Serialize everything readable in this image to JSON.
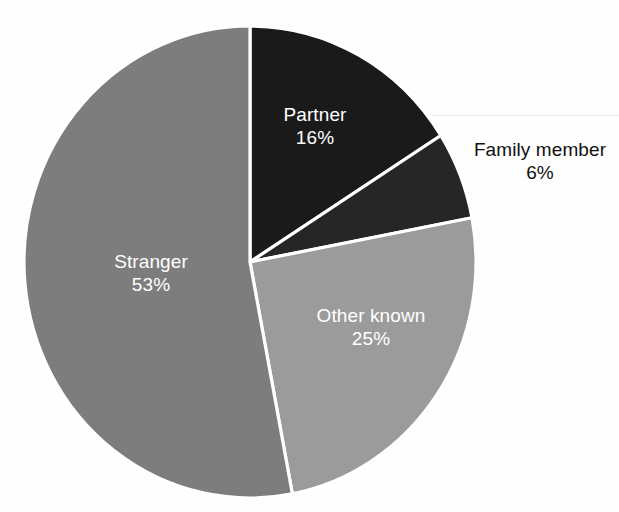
{
  "chart_data": {
    "type": "pie",
    "title": "",
    "subtitle": "",
    "xlabel": "",
    "ylabel": "",
    "legend_position": "none",
    "grid": false,
    "value_unit": "%",
    "start_angle_deg": 0,
    "direction": "clockwise",
    "categories": [
      "Partner",
      "Family member",
      "Other known",
      "Stranger"
    ],
    "values": [
      16,
      6,
      25,
      53
    ],
    "slices": [
      {
        "label": "Partner",
        "value": 16,
        "value_text": "16%",
        "color": "#1a1a1a",
        "label_placement": "inside",
        "label_color": "#ffffff"
      },
      {
        "label": "Family member",
        "value": 6,
        "value_text": "6%",
        "color": "#262626",
        "label_placement": "outside",
        "label_color": "#111111"
      },
      {
        "label": "Other known",
        "value": 25,
        "value_text": "25%",
        "color": "#9b9b9b",
        "label_placement": "inside",
        "label_color": "#ffffff"
      },
      {
        "label": "Stranger",
        "value": 53,
        "value_text": "53%",
        "color": "#7d7d7d",
        "label_placement": "inside",
        "label_color": "#ffffff"
      }
    ],
    "background_color": "#fefefe",
    "slice_border_color": "#ffffff"
  },
  "labels": {
    "partner": {
      "name": "Partner",
      "value": "16%"
    },
    "family_member": {
      "name": "Family member",
      "value": "6%"
    },
    "other_known": {
      "name": "Other known",
      "value": "25%"
    },
    "stranger": {
      "name": "Stranger",
      "value": "53%"
    }
  }
}
